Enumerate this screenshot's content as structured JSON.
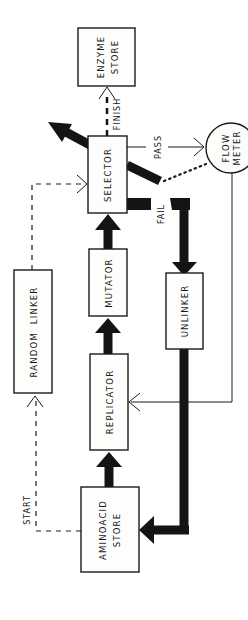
{
  "diagram": {
    "nodes": {
      "enzyme_store": {
        "line1": "ENZYME",
        "line2": "STORE"
      },
      "selector": {
        "label": "SELECTOR"
      },
      "flow_meter": {
        "line1": "FLOW",
        "line2": "METER"
      },
      "mutator": {
        "label": "MUTATOR"
      },
      "unlinker": {
        "label": "UNLINKER"
      },
      "random_linker": {
        "label": "RANDOM  LINKER"
      },
      "replicator": {
        "label": "REPLICATOR"
      },
      "aminoacid_store": {
        "line1": "AMINOACID",
        "line2": "STORE"
      }
    },
    "edges": {
      "finish": "FINISH",
      "pass": "PASS",
      "fail": "FAIL",
      "start": "START"
    },
    "colors": {
      "ink": "#1a1a1a",
      "paper": "#ffffff"
    }
  }
}
